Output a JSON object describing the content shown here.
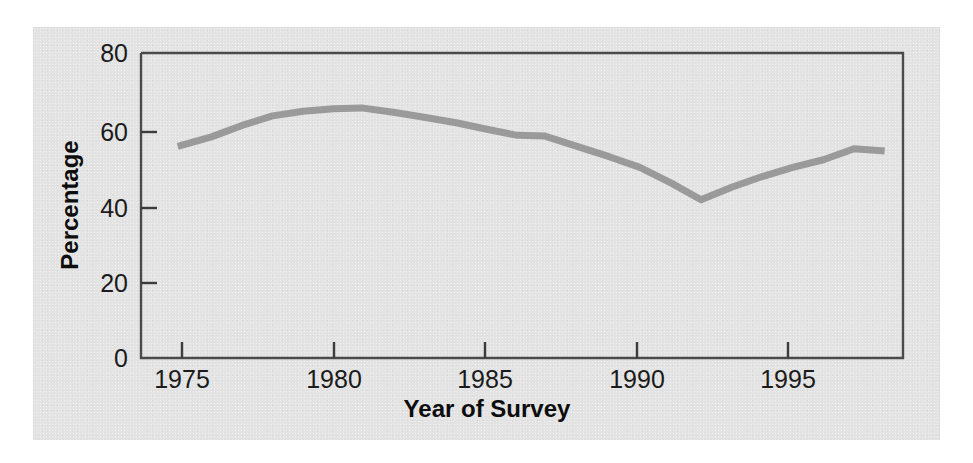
{
  "figure": {
    "background_color": "#e3e3e3",
    "page_color": "#ffffff",
    "frame_color": "#4a4a4a",
    "line_color": "#9a9a9a"
  },
  "chart_data": {
    "type": "line",
    "title": "",
    "xlabel": "Year of Survey",
    "ylabel": "Percentage",
    "xlim": [
      1973.7,
      1998.6
    ],
    "ylim": [
      0,
      80
    ],
    "xticks": [
      1975,
      1980,
      1985,
      1990,
      1995
    ],
    "xtick_labels": [
      "1975",
      "1980",
      "1985",
      "1990",
      "1995"
    ],
    "yticks": [
      0,
      20,
      40,
      60,
      80
    ],
    "ytick_labels": [
      "0",
      "20",
      "40",
      "60",
      "80"
    ],
    "grid": false,
    "legend": false,
    "series": [
      {
        "name": "Percentage",
        "x": [
          1974.9,
          1976.0,
          1977.0,
          1978.0,
          1979.0,
          1980.0,
          1980.9,
          1982.0,
          1983.0,
          1984.0,
          1985.0,
          1986.0,
          1986.9,
          1988.0,
          1989.0,
          1990.0,
          1991.0,
          1992.0,
          1993.0,
          1994.0,
          1995.0,
          1996.0,
          1997.0,
          1998.0
        ],
        "values": [
          55.5,
          58.0,
          61.0,
          63.5,
          64.7,
          65.4,
          65.6,
          64.4,
          63.1,
          61.7,
          60.0,
          58.4,
          58.2,
          55.4,
          52.8,
          50.0,
          46.0,
          41.5,
          44.8,
          47.6,
          50.0,
          52.0,
          54.9,
          54.3
        ]
      }
    ],
    "annotations": []
  }
}
